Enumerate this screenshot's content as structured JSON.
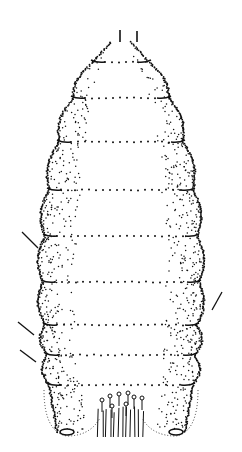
{
  "figure": {
    "ink_color": "#111111",
    "background": "#ffffff",
    "segments": [
      {
        "y": 62,
        "half_width": 28
      },
      {
        "y": 98,
        "half_width": 48
      },
      {
        "y": 142,
        "half_width": 62
      },
      {
        "y": 190,
        "half_width": 72
      },
      {
        "y": 236,
        "half_width": 76
      },
      {
        "y": 282,
        "half_width": 78
      },
      {
        "y": 325,
        "half_width": 76
      },
      {
        "y": 355,
        "half_width": 74
      },
      {
        "y": 385,
        "half_width": 72
      }
    ],
    "antennae": [
      {
        "x": 120,
        "y1": 30,
        "y2": 42
      },
      {
        "x": 137,
        "y1": 31,
        "y2": 42
      }
    ],
    "anal_region": {
      "cx": 121,
      "cy": 415,
      "spiracles": [
        {
          "cx": 67,
          "cy": 432
        },
        {
          "cx": 176,
          "cy": 432
        }
      ]
    }
  }
}
